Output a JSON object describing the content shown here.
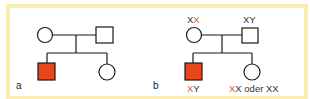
{
  "colors": {
    "frame": "#fbeeb0",
    "affected": "#e8461c",
    "stroke": "#1a1a1a",
    "mutant_allele": "#e8532f"
  },
  "panels": [
    {
      "label": "a",
      "genotypes": null
    },
    {
      "label": "b",
      "genotypes": {
        "mother": {
          "plain": "X",
          "mutant": "X"
        },
        "father": {
          "text": "XY"
        },
        "son": {
          "mutant": "X",
          "plain": "Y"
        },
        "daughter": {
          "mutant": "X",
          "plain": "X",
          "connector": " oder ",
          "alt": "XX"
        }
      }
    }
  ]
}
